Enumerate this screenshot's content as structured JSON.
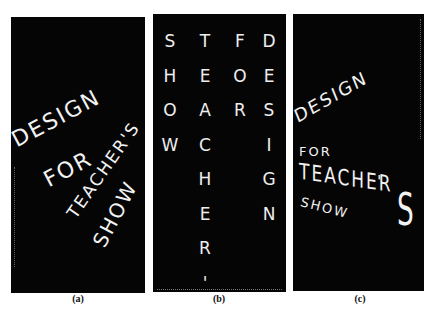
{
  "panels": [
    {
      "id": "a",
      "caption": "(a)",
      "words": [
        "DESIGN",
        "FOR",
        "TEACHER'S",
        "SHOW"
      ],
      "layout": "diagonal-rotated"
    },
    {
      "id": "b",
      "caption": "(b)",
      "columns": [
        {
          "letters": [
            "S",
            "H",
            "O",
            "W"
          ]
        },
        {
          "letters": [
            "T",
            "E",
            "A",
            "C",
            "H",
            "E",
            "R",
            "'",
            "S"
          ]
        },
        {
          "letters": [
            "F",
            "O",
            "R"
          ]
        },
        {
          "letters": [
            "D",
            "E",
            "S",
            "I",
            "G",
            "N"
          ]
        }
      ],
      "layout": "vertical-columns"
    },
    {
      "id": "c",
      "caption": "(c)",
      "words": [
        "DESIGN",
        "FOR",
        "TEACHER",
        "'",
        "S",
        "SHOW"
      ],
      "layout": "perspective"
    }
  ],
  "colors": {
    "panel_bg": "#050505",
    "text": "#f2f2f2",
    "page_bg": "#ffffff"
  }
}
